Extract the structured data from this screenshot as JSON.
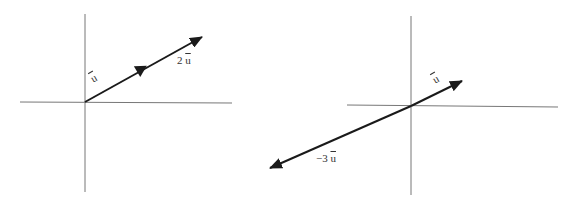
{
  "diagrams": [
    {
      "name": "scaling-by-2",
      "origin": [
        85,
        102
      ],
      "axes": {
        "x_from": 20,
        "x_to": 232,
        "y_from": 14,
        "y_to": 192
      },
      "vectors": [
        {
          "label": "u",
          "coef": "",
          "tip": [
            146,
            68
          ]
        },
        {
          "label": "u",
          "coef": "2",
          "tip": [
            202,
            37
          ]
        }
      ],
      "labels": [
        {
          "text_coef": "",
          "text_vec": "u",
          "x": 92,
          "y": 74,
          "rotate": -30
        },
        {
          "text_coef": "2 ",
          "text_vec": "u",
          "x": 177,
          "y": 56,
          "rotate": 0
        }
      ]
    },
    {
      "name": "scaling-by-minus-3",
      "origin": [
        411,
        106
      ],
      "axes": {
        "x_from": 347,
        "x_to": 558,
        "y_from": 16,
        "y_to": 195
      },
      "vectors": [
        {
          "label": "u",
          "coef": "",
          "tip": [
            462,
            81
          ]
        },
        {
          "label": "u",
          "coef": "−3",
          "tip": [
            270,
            168
          ]
        }
      ],
      "labels": [
        {
          "text_coef": "",
          "text_vec": "u",
          "x": 432,
          "y": 76,
          "rotate": -30
        },
        {
          "text_coef": "−3 ",
          "text_vec": "u",
          "x": 317,
          "y": 154,
          "rotate": 0
        }
      ]
    }
  ],
  "colors": {
    "axis": "#777777",
    "vector": "#1a1a1a"
  }
}
